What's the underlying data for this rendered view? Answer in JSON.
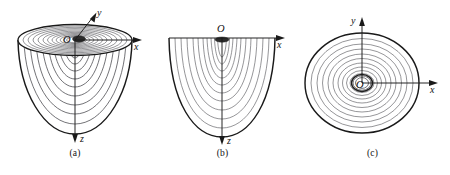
{
  "panels": [
    {
      "id": "a",
      "caption": "(a)",
      "view": "3D perspective of downward-opening paraboloid with horizontal contour rings",
      "origin_label": "O",
      "axes": [
        {
          "name": "x",
          "label": "x",
          "direction": "right"
        },
        {
          "name": "y",
          "label": "y",
          "direction": "upper-right-oblique"
        },
        {
          "name": "z",
          "label": "z",
          "direction": "down"
        }
      ],
      "contour_count": 11
    },
    {
      "id": "b",
      "caption": "(b)",
      "view": "Vertical cross-section showing nested parabolas opening downward",
      "origin_label": "O",
      "axes": [
        {
          "name": "x",
          "label": "x",
          "direction": "right"
        },
        {
          "name": "z",
          "label": "z",
          "direction": "down"
        }
      ],
      "contour_count": 11
    },
    {
      "id": "c",
      "caption": "(c)",
      "view": "Top-down view showing concentric circular level curves",
      "origin_label": "O",
      "axes": [
        {
          "name": "x",
          "label": "x",
          "direction": "right"
        },
        {
          "name": "y",
          "label": "y",
          "direction": "up"
        }
      ],
      "contour_count": 12
    }
  ],
  "colors": {
    "outline": "#1a1a1a",
    "contour": "#55555a",
    "axis": "#1a1a1a",
    "background": "#ffffff"
  }
}
